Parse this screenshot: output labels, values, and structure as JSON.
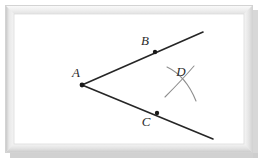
{
  "figure": {
    "canvas": {
      "width": 266,
      "height": 161,
      "background": "#ffffff"
    },
    "frame": {
      "name": "picture-frame",
      "x": 5,
      "y": 5,
      "width": 248,
      "height": 148,
      "border_color_light": "#f2f2f2",
      "border_color_mid": "#d8d8d8",
      "border_color_dark": "#b8b8b8",
      "shadow_color": "#c9c9c9",
      "interior_color": "#ffffff",
      "border_width": 9
    },
    "colors": {
      "line": "#262626",
      "arc": "#8e8e8e",
      "label": "#2b2b2b",
      "dot": "#1a1a1a"
    },
    "vertex": {
      "name": "A",
      "label": "A",
      "x": 82,
      "y": 85,
      "label_x": 76,
      "label_y": 77
    },
    "rays": [
      {
        "name": "ray-AB",
        "from_x": 82,
        "from_y": 85,
        "to_x": 203,
        "to_y": 32,
        "stroke_width": 1.6
      },
      {
        "name": "ray-AC",
        "from_x": 82,
        "from_y": 85,
        "to_x": 213,
        "to_y": 139,
        "stroke_width": 1.6
      }
    ],
    "points": [
      {
        "name": "B",
        "label": "B",
        "x": 155,
        "y": 52,
        "label_x": 145,
        "label_y": 45,
        "radius": 2.2
      },
      {
        "name": "C",
        "label": "C",
        "x": 157,
        "y": 113,
        "label_x": 146,
        "label_y": 126,
        "radius": 2.2
      }
    ],
    "arcs": [
      {
        "name": "arc-from-B",
        "path": "M 167 67 Q 186 76 196 101",
        "stroke_width": 1.1
      },
      {
        "name": "arc-from-C",
        "path": "M 194 66 Q 182 80 165 97",
        "stroke_width": 1.1
      }
    ],
    "intersection_label": {
      "name": "D",
      "label": "D",
      "x": 186,
      "y": 83,
      "label_x": 181,
      "label_y": 76
    }
  }
}
